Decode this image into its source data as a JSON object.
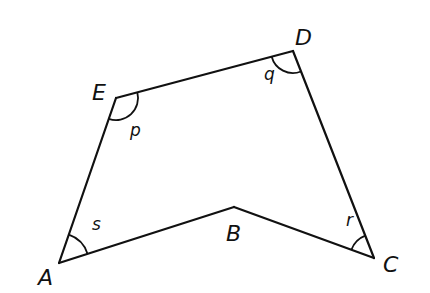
{
  "diagram": {
    "type": "polygon",
    "shape": "pentagon (concave at B)",
    "vertices": [
      {
        "name": "A",
        "x": 59,
        "y": 263,
        "label_x": 38,
        "label_y": 285
      },
      {
        "name": "B",
        "x": 234,
        "y": 207,
        "label_x": 226,
        "label_y": 241
      },
      {
        "name": "C",
        "x": 374,
        "y": 258,
        "label_x": 383,
        "label_y": 272
      },
      {
        "name": "D",
        "x": 293,
        "y": 51,
        "label_x": 295,
        "label_y": 45
      },
      {
        "name": "E",
        "x": 116,
        "y": 98,
        "label_x": 92,
        "label_y": 100
      }
    ],
    "edges": [
      [
        "A",
        "B"
      ],
      [
        "B",
        "C"
      ],
      [
        "C",
        "D"
      ],
      [
        "D",
        "E"
      ],
      [
        "E",
        "A"
      ]
    ],
    "angles": [
      {
        "label": "p",
        "vertex": "E",
        "text_x": 130,
        "text_y": 138
      },
      {
        "label": "q",
        "vertex": "D",
        "text_x": 265,
        "text_y": 82
      },
      {
        "label": "r",
        "vertex": "C",
        "text_x": 346,
        "text_y": 226
      },
      {
        "label": "s",
        "vertex": "A",
        "text_x": 92,
        "text_y": 231
      }
    ]
  },
  "labels": {
    "A": "A",
    "B": "B",
    "C": "C",
    "D": "D",
    "E": "E",
    "p": "p",
    "q": "q",
    "r": "r",
    "s": "s"
  },
  "colors": {
    "stroke": "#111111",
    "background": "#ffffff"
  }
}
